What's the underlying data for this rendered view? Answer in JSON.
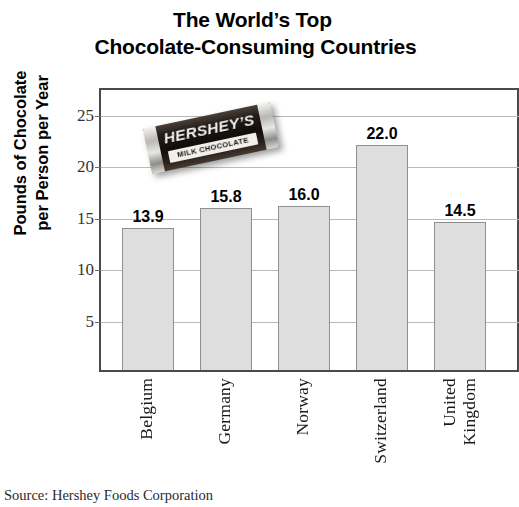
{
  "title": {
    "line1": "The World’s Top",
    "line2": "Chocolate-Consuming Countries"
  },
  "y_axis_title": {
    "line1": "Pounds of Chocolate",
    "line2": "per Person per Year"
  },
  "source": "Source: Hershey Foods Corporation",
  "overlay_image": {
    "name": "hershey-chocolate-bar-photo",
    "brand": "HERSHEY’S",
    "subtitle": "MILK CHOCOLATE"
  },
  "colors": {
    "bar_fill": "#dedede",
    "bar_border": "#8f8f8f",
    "axis": "#4a4a4a",
    "gridline": "#b9b9b9",
    "text": "#000000"
  },
  "chart_data": {
    "type": "bar",
    "title": "The World’s Top Chocolate-Consuming Countries",
    "xlabel": "",
    "ylabel": "Pounds of Chocolate per Person per Year",
    "categories": [
      "Belgium",
      "Germany",
      "Norway",
      "Switzerland",
      "United Kingdom"
    ],
    "category_lines": [
      [
        "Belgium"
      ],
      [
        "Germany"
      ],
      [
        "Norway"
      ],
      [
        "Switzerland"
      ],
      [
        "United",
        "Kingdom"
      ]
    ],
    "values": [
      13.9,
      15.8,
      16.0,
      22.0,
      14.5
    ],
    "value_labels": [
      "13.9",
      "15.8",
      "16.0",
      "22.0",
      "14.5"
    ],
    "ylim": [
      0,
      27.5
    ],
    "yticks": [
      5,
      10,
      15,
      20,
      25
    ],
    "ytick_labels": [
      "5",
      "10",
      "15",
      "20",
      "25"
    ],
    "grid": true,
    "legend": false,
    "source": "Source: Hershey Foods Corporation"
  }
}
